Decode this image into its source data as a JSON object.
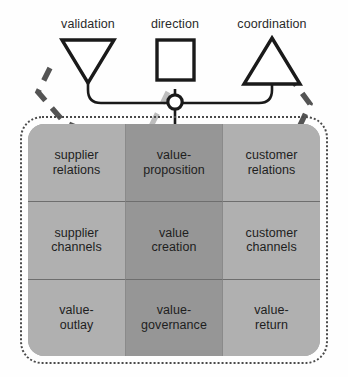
{
  "diagram": {
    "top_nodes": [
      {
        "label": "validation",
        "shape": "triangle-down",
        "cx": 88,
        "cy": 68
      },
      {
        "label": "direction",
        "shape": "square",
        "cx": 175,
        "cy": 64
      },
      {
        "label": "coordination",
        "shape": "triangle-up",
        "cx": 272,
        "cy": 68
      }
    ],
    "junction": {
      "name": "junction-node",
      "cx": 175,
      "cy": 102,
      "r": 7
    },
    "grid": {
      "columns": [
        "supplier",
        "value",
        "customer"
      ],
      "rows": [
        [
          {
            "label": "supplier\nrelations",
            "line1": "supplier",
            "line2": "relations"
          },
          {
            "label": "value-\nproposition",
            "line1": "value-",
            "line2": "proposition"
          },
          {
            "label": "customer\nrelations",
            "line1": "customer",
            "line2": "relations"
          }
        ],
        [
          {
            "label": "supplier\nchannels",
            "line1": "supplier",
            "line2": "channels"
          },
          {
            "label": "value\ncreation",
            "line1": "value",
            "line2": "creation"
          },
          {
            "label": "customer\nchannels",
            "line1": "customer",
            "line2": "channels"
          }
        ],
        [
          {
            "label": "value-\noutlay",
            "line1": "value-",
            "line2": "outlay"
          },
          {
            "label": "value-\ngovernance",
            "line1": "value-",
            "line2": "governance"
          },
          {
            "label": "value-\nreturn",
            "line1": "value-",
            "line2": "return"
          }
        ]
      ]
    },
    "connectors": [
      {
        "name": "validation-to-value-proposition",
        "style": "dashed-dark",
        "from": "validation",
        "to": "value-proposition",
        "arrow": true
      },
      {
        "name": "coordination-to-value-creation",
        "style": "dashed-dark",
        "from": "coordination",
        "to": "value-creation",
        "arrow": true
      },
      {
        "name": "direction-to-value-governance",
        "style": "dashed-light",
        "from": "direction",
        "to": "value-governance",
        "arrow": true
      },
      {
        "name": "validation-to-junction",
        "style": "solid",
        "from": "validation",
        "to": "junction",
        "arrow": false
      },
      {
        "name": "coordination-to-junction",
        "style": "solid",
        "from": "coordination",
        "to": "junction",
        "arrow": false
      },
      {
        "name": "direction-to-junction",
        "style": "solid",
        "from": "direction",
        "to": "junction",
        "arrow": false
      },
      {
        "name": "junction-to-grid",
        "style": "solid",
        "from": "junction",
        "to": "grid",
        "arrow": false
      }
    ],
    "colors": {
      "cell_light": "#b0b0b0",
      "cell_dark": "#969696",
      "stroke": "#1a1a1a",
      "dash_dark": "#4a4a4a",
      "dash_light": "#b9b9b9",
      "border_dotted": "#4a4a4a",
      "background": "#fefefe"
    }
  }
}
